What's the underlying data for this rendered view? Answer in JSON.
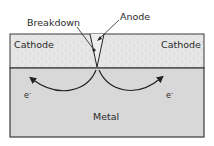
{
  "diagram": {
    "labels": {
      "breakdown": "Breakdown",
      "anode": "Anode",
      "cathode_left": "Cathode",
      "cathode_right": "Cathode",
      "metal": "Metal",
      "electron_left": "e",
      "electron_right": "e",
      "electron_sup": "-"
    },
    "colors": {
      "cathode_fill": "#e4e4e4",
      "metal_fill": "#d6d6d6",
      "outline": "#3a3a3a",
      "arrow": "#222222"
    }
  }
}
